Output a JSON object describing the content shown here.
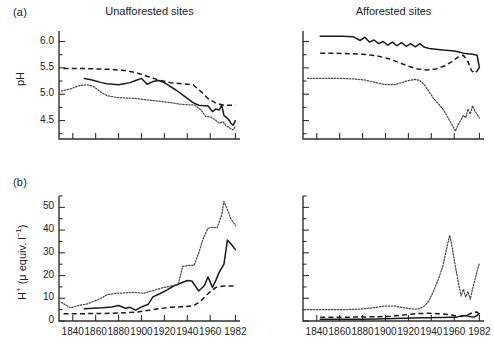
{
  "figure": {
    "panel_a_label": "(a)",
    "panel_b_label": "(b)",
    "title_left": "Unafforested sites",
    "title_right": "Afforested sites",
    "ylabel_a": "pH",
    "ylabel_b_html": "H+ (μ equiv. l-1)",
    "ylabel_b_plain": "H+ (μ equiv. l⁻¹)"
  },
  "chart_data": [
    {
      "id": "panel-a-unafforested",
      "type": "line",
      "title": "Unafforested sites",
      "panel": "(a)",
      "xlabel": "",
      "ylabel": "pH",
      "xlim": [
        1828,
        1986
      ],
      "ylim": [
        4.15,
        6.2
      ],
      "yticks": [
        4.5,
        5.0,
        5.5,
        6.0
      ],
      "ytick_labels": [
        "4.5",
        "5.0",
        "5.5",
        "6.0"
      ],
      "y_minor_step": 0.25,
      "xticks": [
        1840,
        1860,
        1880,
        1900,
        1920,
        1940,
        1960,
        1982
      ],
      "xtick_labels": [
        "",
        "",
        "",
        "",
        "",
        "",
        "",
        ""
      ],
      "grid": false,
      "legend": "none",
      "series": [
        {
          "name": "site-solid",
          "style": "solid",
          "x": [
            1850,
            1855,
            1860,
            1865,
            1870,
            1875,
            1880,
            1885,
            1890,
            1895,
            1900,
            1905,
            1910,
            1915,
            1920,
            1925,
            1930,
            1935,
            1940,
            1945,
            1950,
            1955,
            1958,
            1962,
            1965,
            1968,
            1970,
            1972,
            1974,
            1976,
            1978,
            1980,
            1982
          ],
          "y": [
            5.3,
            5.28,
            5.25,
            5.22,
            5.2,
            5.19,
            5.18,
            5.2,
            5.22,
            5.26,
            5.3,
            5.19,
            5.24,
            5.26,
            5.22,
            5.15,
            5.08,
            5.0,
            4.92,
            4.84,
            4.79,
            4.78,
            4.78,
            4.67,
            4.72,
            4.7,
            4.8,
            4.6,
            4.56,
            4.52,
            4.45,
            4.41,
            4.5
          ]
        },
        {
          "name": "site-dashed",
          "style": "dashed",
          "x": [
            1832,
            1845,
            1860,
            1875,
            1885,
            1895,
            1905,
            1915,
            1925,
            1935,
            1945,
            1952,
            1958,
            1965,
            1972,
            1982
          ],
          "y": [
            5.49,
            5.49,
            5.48,
            5.47,
            5.45,
            5.41,
            5.34,
            5.27,
            5.22,
            5.2,
            5.18,
            5.05,
            4.92,
            4.83,
            4.79,
            4.79
          ]
        },
        {
          "name": "site-dotted",
          "style": "dotted",
          "x": [
            1830,
            1838,
            1845,
            1852,
            1858,
            1864,
            1870,
            1878,
            1886,
            1894,
            1902,
            1910,
            1918,
            1926,
            1934,
            1940,
            1946,
            1952,
            1956,
            1960,
            1964,
            1968,
            1971,
            1974,
            1977,
            1980,
            1982
          ],
          "y": [
            5.06,
            5.1,
            5.16,
            5.18,
            5.15,
            5.05,
            4.97,
            4.94,
            4.93,
            4.92,
            4.9,
            4.88,
            4.86,
            4.84,
            4.81,
            4.8,
            4.8,
            4.7,
            4.58,
            4.57,
            4.52,
            4.45,
            4.48,
            4.4,
            4.36,
            4.32,
            4.4
          ]
        }
      ]
    },
    {
      "id": "panel-a-afforested",
      "type": "line",
      "title": "Afforested sites",
      "panel": "(a)",
      "xlabel": "",
      "ylabel": "pH",
      "xlim": [
        1828,
        1986
      ],
      "ylim": [
        4.15,
        6.2
      ],
      "yticks": [
        4.5,
        5.0,
        5.5,
        6.0
      ],
      "ytick_labels": [
        "",
        "",
        "",
        ""
      ],
      "y_minor_step": 0.25,
      "xticks": [
        1840,
        1860,
        1880,
        1900,
        1920,
        1940,
        1960,
        1982
      ],
      "xtick_labels": [
        "",
        "",
        "",
        "",
        "",
        "",
        "",
        ""
      ],
      "grid": false,
      "legend": "none",
      "series": [
        {
          "name": "site-solid",
          "style": "solid",
          "x": [
            1843,
            1852,
            1862,
            1872,
            1878,
            1882,
            1886,
            1890,
            1894,
            1898,
            1902,
            1906,
            1910,
            1914,
            1918,
            1922,
            1926,
            1930,
            1934,
            1938,
            1942,
            1946,
            1950,
            1955,
            1960,
            1964,
            1968,
            1972,
            1976,
            1980,
            1982
          ],
          "y": [
            6.1,
            6.1,
            6.1,
            6.09,
            6.02,
            6.08,
            5.99,
            6.03,
            5.96,
            6.0,
            5.93,
            5.99,
            5.92,
            5.98,
            5.91,
            5.96,
            5.9,
            5.96,
            5.89,
            5.87,
            5.86,
            5.85,
            5.84,
            5.83,
            5.82,
            5.8,
            5.78,
            5.77,
            5.76,
            5.74,
            5.5
          ]
        },
        {
          "name": "site-dashed",
          "style": "dashed",
          "x": [
            1843,
            1855,
            1868,
            1880,
            1892,
            1902,
            1912,
            1920,
            1928,
            1936,
            1944,
            1952,
            1958,
            1963,
            1968,
            1972,
            1975,
            1978,
            1980,
            1982
          ],
          "y": [
            5.78,
            5.78,
            5.77,
            5.76,
            5.73,
            5.68,
            5.6,
            5.53,
            5.48,
            5.46,
            5.48,
            5.54,
            5.62,
            5.7,
            5.74,
            5.62,
            5.45,
            5.4,
            5.44,
            5.52
          ]
        },
        {
          "name": "site-dotted",
          "style": "dotted",
          "x": [
            1832,
            1842,
            1852,
            1862,
            1872,
            1882,
            1892,
            1900,
            1908,
            1914,
            1920,
            1926,
            1930,
            1934,
            1938,
            1942,
            1946,
            1950,
            1954,
            1958,
            1961,
            1964,
            1966,
            1968,
            1970,
            1972,
            1974,
            1976,
            1978,
            1980,
            1982
          ],
          "y": [
            5.3,
            5.3,
            5.3,
            5.3,
            5.29,
            5.27,
            5.22,
            5.18,
            5.18,
            5.22,
            5.26,
            5.28,
            5.26,
            5.18,
            5.05,
            4.92,
            4.82,
            4.72,
            4.58,
            4.42,
            4.3,
            4.44,
            4.52,
            4.6,
            4.55,
            4.72,
            4.62,
            4.78,
            4.68,
            4.62,
            4.55
          ]
        }
      ]
    },
    {
      "id": "panel-b-unafforested",
      "type": "line",
      "title": "Unafforested sites",
      "panel": "(b)",
      "xlabel": "",
      "ylabel": "H+ (μ equiv. l⁻¹)",
      "xlim": [
        1828,
        1986
      ],
      "ylim": [
        0,
        55
      ],
      "yticks": [
        0,
        10,
        20,
        30,
        40,
        50
      ],
      "ytick_labels": [
        "0",
        "10",
        "20",
        "30",
        "40",
        "50"
      ],
      "y_minor_step": 5,
      "xticks": [
        1840,
        1860,
        1880,
        1900,
        1920,
        1940,
        1960,
        1982
      ],
      "xtick_labels": [
        "1840",
        "1860",
        "1880",
        "1900",
        "1920",
        "1940",
        "1960",
        "1982"
      ],
      "grid": false,
      "legend": "none",
      "series": [
        {
          "name": "site-solid",
          "style": "solid",
          "x": [
            1850,
            1858,
            1866,
            1874,
            1880,
            1886,
            1890,
            1895,
            1900,
            1906,
            1910,
            1916,
            1922,
            1928,
            1934,
            1940,
            1944,
            1950,
            1955,
            1958,
            1962,
            1965,
            1968,
            1972,
            1975,
            1978,
            1982
          ],
          "y": [
            5.4,
            5.6,
            5.8,
            6.2,
            6.8,
            5.6,
            6.0,
            4.8,
            6.2,
            7.4,
            10.6,
            12.0,
            13.6,
            15.4,
            16.6,
            17.8,
            17.6,
            13.2,
            15.6,
            19.4,
            14.8,
            18.0,
            21.6,
            25.0,
            35.6,
            34.0,
            31.4
          ]
        },
        {
          "name": "site-dashed",
          "style": "dashed",
          "x": [
            1832,
            1845,
            1860,
            1875,
            1885,
            1895,
            1905,
            1915,
            1925,
            1935,
            1945,
            1952,
            1958,
            1965,
            1972,
            1982
          ],
          "y": [
            3.2,
            3.2,
            3.3,
            3.4,
            3.6,
            3.9,
            4.6,
            5.4,
            6.0,
            6.3,
            6.6,
            8.9,
            12.0,
            14.8,
            15.4,
            15.4
          ]
        },
        {
          "name": "site-dotted",
          "style": "dotted",
          "x": [
            1830,
            1838,
            1845,
            1852,
            1858,
            1864,
            1870,
            1878,
            1886,
            1894,
            1902,
            1910,
            1918,
            1926,
            1932,
            1936,
            1940,
            1946,
            1950,
            1954,
            1958,
            1962,
            1966,
            1970,
            1972,
            1975,
            1978,
            1982
          ],
          "y": [
            8.2,
            5.8,
            6.8,
            7.4,
            8.6,
            9.8,
            11.6,
            12.2,
            12.4,
            12.6,
            12.2,
            13.4,
            14.6,
            15.4,
            16.0,
            24.0,
            24.4,
            24.6,
            30.0,
            36.4,
            40.8,
            41.2,
            41.0,
            46.6,
            52.6,
            49.0,
            45.0,
            42.0
          ]
        }
      ]
    },
    {
      "id": "panel-b-afforested",
      "type": "line",
      "title": "Afforested sites",
      "panel": "(b)",
      "xlabel": "",
      "ylabel": "H+ (μ equiv. l⁻¹)",
      "xlim": [
        1828,
        1986
      ],
      "ylim": [
        0,
        55
      ],
      "yticks": [
        0,
        10,
        20,
        30,
        40,
        50
      ],
      "ytick_labels": [
        "",
        "",
        "",
        "",
        "",
        ""
      ],
      "y_minor_step": 5,
      "xticks": [
        1840,
        1860,
        1880,
        1900,
        1920,
        1940,
        1960,
        1982
      ],
      "xtick_labels": [
        "1840",
        "1860",
        "1880",
        "1900",
        "1920",
        "1940",
        "1960",
        "1982"
      ],
      "grid": false,
      "legend": "none",
      "series": [
        {
          "name": "site-solid",
          "style": "solid",
          "x": [
            1843,
            1855,
            1868,
            1880,
            1892,
            1900,
            1908,
            1916,
            1924,
            1932,
            1938,
            1944,
            1950,
            1956,
            1962,
            1966,
            1970,
            1974,
            1978,
            1982
          ],
          "y": [
            0.8,
            0.8,
            0.8,
            0.8,
            0.9,
            1.0,
            1.1,
            1.2,
            1.3,
            1.4,
            1.4,
            1.5,
            1.5,
            1.6,
            1.7,
            2.2,
            2.4,
            1.9,
            1.8,
            3.2
          ]
        },
        {
          "name": "site-dashed",
          "style": "dashed",
          "x": [
            1843,
            1856,
            1870,
            1882,
            1894,
            1904,
            1914,
            1922,
            1930,
            1938,
            1946,
            1954,
            1960,
            1966,
            1972,
            1976,
            1980,
            1982
          ],
          "y": [
            1.7,
            1.7,
            1.7,
            1.8,
            1.9,
            2.1,
            2.5,
            3.0,
            3.3,
            3.4,
            3.2,
            2.9,
            2.4,
            2.0,
            2.8,
            3.6,
            4.0,
            3.0
          ]
        },
        {
          "name": "site-dotted",
          "style": "dotted",
          "x": [
            1832,
            1842,
            1852,
            1862,
            1872,
            1882,
            1892,
            1900,
            1908,
            1914,
            1920,
            1926,
            1930,
            1934,
            1938,
            1942,
            1946,
            1950,
            1953,
            1956,
            1958,
            1961,
            1964,
            1966,
            1968,
            1970,
            1972,
            1974,
            1976,
            1978,
            1980,
            1982
          ],
          "y": [
            5.0,
            5.0,
            5.0,
            5.0,
            5.1,
            5.4,
            6.0,
            6.6,
            6.6,
            6.0,
            5.5,
            5.2,
            5.5,
            6.6,
            8.9,
            13.2,
            18.2,
            24.0,
            31.0,
            37.8,
            33.0,
            24.0,
            16.0,
            11.0,
            14.0,
            10.5,
            13.0,
            9.5,
            14.0,
            18.0,
            22.0,
            25.5
          ]
        }
      ]
    }
  ]
}
